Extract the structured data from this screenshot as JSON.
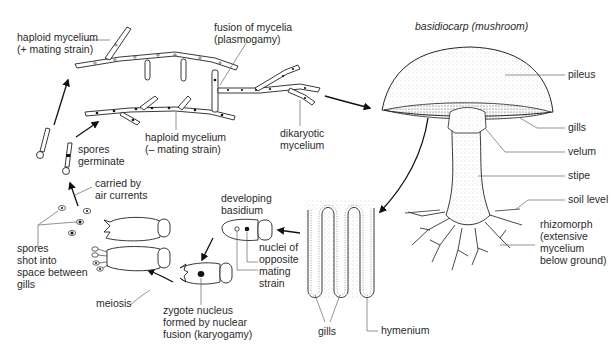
{
  "title": "basidiocarp (mushroom)",
  "labels": {
    "haploid_plus": [
      "haploid mycelium",
      "(+ mating strain)"
    ],
    "fusion": [
      "fusion of mycelia",
      "(plasmogamy)"
    ],
    "haploid_minus": [
      "haploid mycelium",
      "(– mating strain)"
    ],
    "dikaryotic": [
      "dikaryotic",
      "mycelium"
    ],
    "spores_germinate": [
      "spores",
      "germinate"
    ],
    "carried": [
      "carried by",
      "air currents"
    ],
    "spores_shot": [
      "spores",
      "shot into",
      "space between",
      "gills"
    ],
    "meiosis": "meiosis",
    "zygote": [
      "zygote nucleus",
      "formed by nuclear",
      "fusion (karyogamy)"
    ],
    "developing_basidium": [
      "developing",
      "basidium"
    ],
    "nuclei": [
      "nuclei of",
      "opposite",
      "mating",
      "strain"
    ],
    "gills_section": "gills",
    "hymenium": "hymenium",
    "pileus": "pileus",
    "gills": "gills",
    "velum": "velum",
    "stipe": "stipe",
    "soil_level": "soil level",
    "rhizomorph": [
      "rhizomorph",
      "(extensive",
      "mycelium",
      "below ground)"
    ]
  },
  "colors": {
    "ink": "#222222",
    "leader": "#666666",
    "background": "#ffffff"
  }
}
